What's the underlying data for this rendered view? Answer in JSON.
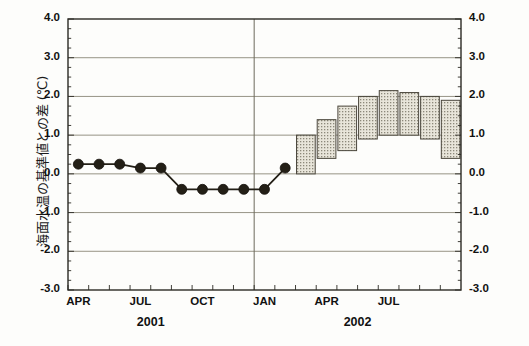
{
  "chart_data": {
    "type": "bar",
    "title": "",
    "subtitle": "",
    "ylabel": "海面水温の基準値との差 (℃)",
    "xlabel": "",
    "ylim": [
      -3.0,
      4.0
    ],
    "ytick_labels": [
      "4.0",
      "3.0",
      "2.0",
      "1.0",
      "0.0",
      "-1.0",
      "-2.0",
      "-3.0"
    ],
    "ytick_values": [
      4.0,
      3.0,
      2.0,
      1.0,
      0.0,
      -1.0,
      -2.0,
      -3.0
    ],
    "grid": true,
    "legend_position": "none",
    "x_axis": {
      "month_tick_labels": [
        "APR",
        "JUL",
        "OCT",
        "JAN",
        "APR",
        "JUL"
      ],
      "month_tick_indices": [
        0,
        3,
        6,
        9,
        12,
        15
      ],
      "year_labels": [
        "2001",
        "2002"
      ],
      "year_label_indices": [
        3.5,
        13.5
      ],
      "n_slots": 19,
      "divider_index": 9
    },
    "observed_series": {
      "name": "観測値",
      "marker": "filled-circle",
      "color": "#231f16",
      "x_indices": [
        0,
        1,
        2,
        3,
        4,
        5,
        6,
        7,
        8,
        9,
        10
      ],
      "values": [
        0.25,
        0.25,
        0.25,
        0.15,
        0.15,
        -0.4,
        -0.4,
        -0.4,
        -0.4,
        -0.4,
        0.15
      ]
    },
    "forecast_bars": {
      "name": "予測範囲",
      "fill": "#dedace",
      "pattern": "dots",
      "edge_color": "#4a463c",
      "x_indices": [
        11,
        12,
        13,
        14,
        15,
        16,
        17,
        18
      ],
      "low": [
        0.0,
        0.4,
        0.6,
        0.9,
        1.0,
        1.0,
        0.9,
        0.4
      ],
      "high": [
        1.0,
        1.4,
        1.75,
        2.0,
        2.15,
        2.1,
        2.0,
        1.9
      ]
    }
  }
}
